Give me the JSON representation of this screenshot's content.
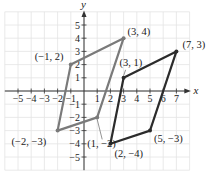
{
  "chart_data": {
    "type": "scatter",
    "title": "",
    "xlabel": "x",
    "ylabel": "y",
    "xlim": [
      -6,
      8
    ],
    "ylim": [
      -6,
      6
    ],
    "grid": true,
    "x_ticks": [
      -5,
      -4,
      -3,
      -2,
      -1,
      1,
      2,
      3,
      4,
      5,
      6,
      7
    ],
    "y_ticks": [
      -5,
      -4,
      -3,
      -2,
      -1,
      1,
      2,
      3,
      4,
      5
    ],
    "series": [
      {
        "name": "parallelogram-1",
        "color": "#7a7a7a",
        "closed": true,
        "points": [
          {
            "x": -1,
            "y": 2,
            "label": "(−1, 2)"
          },
          {
            "x": 3,
            "y": 4,
            "label": "(3, 4)"
          },
          {
            "x": 1,
            "y": -2,
            "label": "(1, −2)"
          },
          {
            "x": -2,
            "y": -3,
            "label": "(−2, −3)"
          }
        ]
      },
      {
        "name": "parallelogram-2",
        "color": "#2b2b2b",
        "closed": true,
        "points": [
          {
            "x": 3,
            "y": 1,
            "label": "(3, 1)"
          },
          {
            "x": 7,
            "y": 3,
            "label": "(7, 3)"
          },
          {
            "x": 5,
            "y": -3,
            "label": "(5, −3)"
          },
          {
            "x": 2,
            "y": -4,
            "label": "(2, −4)"
          }
        ]
      }
    ]
  }
}
